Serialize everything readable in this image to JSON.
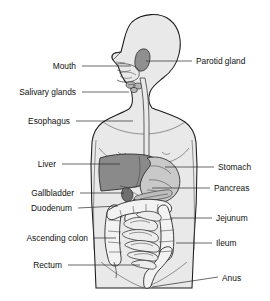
{
  "diagram": {
    "colors": {
      "background": "#ffffff",
      "body_fill": "#e9e9e9",
      "outline": "#1b1b1b",
      "liver": "#8a8a8a",
      "stomach": "#c9c9c9",
      "pancreas": "#bdbdbd",
      "gallbladder": "#6f6f6f",
      "parotid": "#8f8f8f",
      "intestine": "#f2f2f2",
      "label_text": "#111111",
      "leader_line": "#2a2a2a"
    },
    "labels_left": [
      {
        "id": "mouth",
        "text": "Mouth",
        "text_x": 76,
        "text_y": 69,
        "line_x1": 82,
        "line_y1": 66,
        "line_x2": 131,
        "line_y2": 66
      },
      {
        "id": "salivary-glands",
        "text": "Salivary glands",
        "text_x": 76,
        "text_y": 95,
        "line_x1": 82,
        "line_y1": 92,
        "line_x2": 129,
        "line_y2": 92
      },
      {
        "id": "esophagus",
        "text": "Esophagus",
        "text_x": 70,
        "text_y": 124,
        "line_x1": 76,
        "line_y1": 121,
        "line_x2": 133,
        "line_y2": 121
      },
      {
        "id": "liver",
        "text": "Liver",
        "text_x": 56,
        "text_y": 167,
        "line_x1": 62,
        "line_y1": 164,
        "line_x2": 120,
        "line_y2": 164
      },
      {
        "id": "gallbladder",
        "text": "Gallbladder",
        "text_x": 74,
        "text_y": 196,
        "line_x1": 80,
        "line_y1": 193,
        "line_x2": 124,
        "line_y2": 193
      },
      {
        "id": "duodenum",
        "text": "Duodenum",
        "text_x": 72,
        "text_y": 211,
        "line_x1": 78,
        "line_y1": 208,
        "line_x2": 118,
        "line_y2": 206
      },
      {
        "id": "ascending-colon",
        "text": "Ascending colon",
        "text_x": 88,
        "text_y": 241,
        "line_x1": 93,
        "line_y1": 238,
        "line_x2": 116,
        "line_y2": 238
      },
      {
        "id": "rectum",
        "text": "Rectum",
        "text_x": 62,
        "text_y": 268,
        "line_x1": 68,
        "line_y1": 265,
        "line_x2": 140,
        "line_y2": 265
      }
    ],
    "labels_right": [
      {
        "id": "parotid-gland",
        "text": "Parotid gland",
        "text_x": 196,
        "text_y": 64,
        "line_x1": 146,
        "line_y1": 61,
        "line_x2": 192,
        "line_y2": 61
      },
      {
        "id": "stomach",
        "text": "Stomach",
        "text_x": 218,
        "text_y": 170,
        "line_x1": 165,
        "line_y1": 167,
        "line_x2": 214,
        "line_y2": 167
      },
      {
        "id": "pancreas",
        "text": "Pancreas",
        "text_x": 214,
        "text_y": 191,
        "line_x1": 152,
        "line_y1": 188,
        "line_x2": 210,
        "line_y2": 188
      },
      {
        "id": "jejunum",
        "text": "Jejunum",
        "text_x": 216,
        "text_y": 221,
        "line_x1": 170,
        "line_y1": 218,
        "line_x2": 212,
        "line_y2": 218
      },
      {
        "id": "ileum",
        "text": "Ileum",
        "text_x": 216,
        "text_y": 246,
        "line_x1": 176,
        "line_y1": 243,
        "line_x2": 212,
        "line_y2": 243
      },
      {
        "id": "anus",
        "text": "Anus",
        "text_x": 222,
        "text_y": 281,
        "line_x1": 152,
        "line_y1": 287,
        "line_x2": 218,
        "line_y2": 277
      }
    ]
  }
}
